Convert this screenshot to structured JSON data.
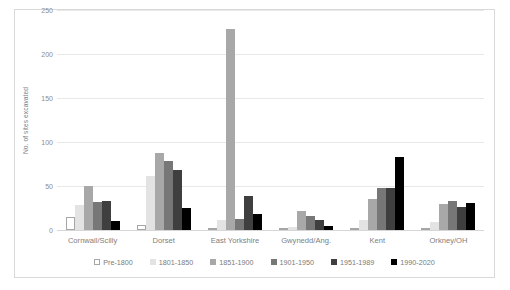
{
  "chart_data": {
    "type": "bar",
    "title": "",
    "xlabel": "",
    "ylabel": "No. of sites excavated",
    "ylim": [
      0,
      250
    ],
    "yticks": [
      0,
      50,
      100,
      150,
      200,
      250
    ],
    "grid": true,
    "legend_position": "bottom",
    "categories": [
      "Cornwall/Scilly",
      "Dorset",
      "East Yorkshire",
      "Gwynedd/Ang.",
      "Kent",
      "Orkney/OH"
    ],
    "series": [
      {
        "name": "Pre-1800",
        "color": "#ffffff",
        "border": "#a6a6a6",
        "values": [
          15,
          6,
          1,
          1,
          1,
          1
        ]
      },
      {
        "name": "1801-1850",
        "color": "#e3e3e3",
        "border": "#e3e3e3",
        "values": [
          28,
          61,
          11,
          3,
          11,
          9
        ]
      },
      {
        "name": "1851-1900",
        "color": "#a8a8a8",
        "border": "#a8a8a8",
        "values": [
          50,
          88,
          228,
          22,
          35,
          30
        ]
      },
      {
        "name": "1901-1950",
        "color": "#777777",
        "border": "#777777",
        "values": [
          32,
          78,
          12,
          16,
          48,
          33
        ]
      },
      {
        "name": "1951-1989",
        "color": "#3f3f3f",
        "border": "#3f3f3f",
        "values": [
          33,
          68,
          39,
          11,
          48,
          26
        ]
      },
      {
        "name": "1990-2020",
        "color": "#000000",
        "border": "#000000",
        "values": [
          10,
          25,
          18,
          5,
          83,
          31
        ]
      }
    ]
  },
  "axis": {
    "y_title": "No. of sites excavated",
    "y_tick_labels": [
      "0",
      "50",
      "100",
      "150",
      "200",
      "250"
    ]
  },
  "legend": {
    "items": [
      {
        "label": "Pre-1800"
      },
      {
        "label": "1801-1850"
      },
      {
        "label": "1851-1900"
      },
      {
        "label": "1901-1950"
      },
      {
        "label": "1951-1989"
      },
      {
        "label": "1990-2020"
      }
    ]
  }
}
